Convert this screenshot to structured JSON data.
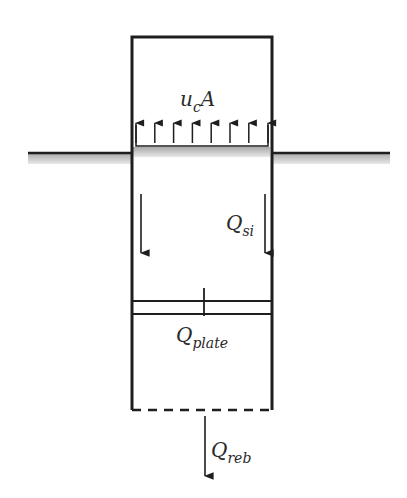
{
  "diagram": {
    "type": "pile-plate free body diagram",
    "labels": {
      "top_load": {
        "main": "u",
        "sub": "c",
        "suffix": "A"
      },
      "side_friction": {
        "main": "Q",
        "sub": "si"
      },
      "plate": {
        "main": "Q",
        "sub": "plate"
      },
      "base": {
        "main": "Q",
        "sub": "reb"
      }
    },
    "colors": {
      "line": "#1e1e1e",
      "ground_shade": "#b8b8b8"
    },
    "upward_arrow_count": 8
  }
}
